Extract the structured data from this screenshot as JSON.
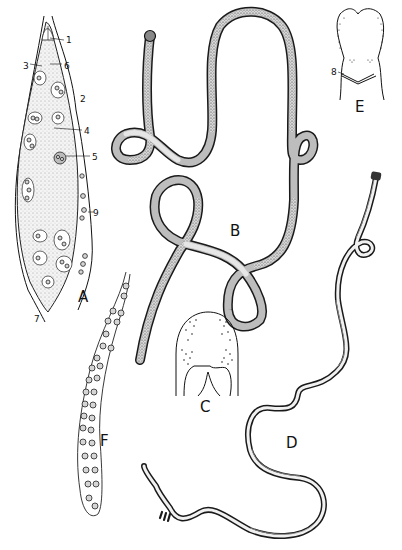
{
  "plate": {
    "background": "#ffffff",
    "ink_color": "#111111",
    "figures": [
      {
        "id": "A",
        "label": "A",
        "description": "whole female worm in longitudinal view, with numbered structures"
      },
      {
        "id": "B",
        "label": "B",
        "description": "long coiled worm, stippled body"
      },
      {
        "id": "C",
        "label": "C",
        "description": "anterior end detail with papillae"
      },
      {
        "id": "D",
        "label": "D",
        "description": "long sinuous worm with dark outline"
      },
      {
        "id": "E",
        "label": "E",
        "description": "head detail, structure 8 marked"
      },
      {
        "id": "F",
        "label": "F",
        "description": "tube filled with eggs"
      }
    ],
    "numbered_parts": [
      {
        "label": "1"
      },
      {
        "label": "2"
      },
      {
        "label": "3"
      },
      {
        "label": "4"
      },
      {
        "label": "5"
      },
      {
        "label": "6"
      },
      {
        "label": "7"
      },
      {
        "label": "8"
      },
      {
        "label": "9"
      }
    ]
  }
}
